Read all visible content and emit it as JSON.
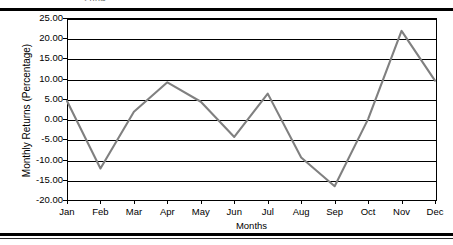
{
  "figure": {
    "top_caption_fragment": "2004",
    "background_color": "#ffffff",
    "line_color": "#808080",
    "grid_color": "#000000",
    "axis_color": "#000000"
  },
  "chart_data": {
    "type": "line",
    "title": "",
    "xlabel": "Months",
    "ylabel": "Monthly Returns (Percentage)",
    "categories": [
      "Jan",
      "Feb",
      "Mar",
      "Apr",
      "May",
      "Jun",
      "Jul",
      "Aug",
      "Sep",
      "Oct",
      "Nov",
      "Dec"
    ],
    "values": [
      4.5,
      -12.2,
      1.8,
      9.1,
      4.3,
      -4.4,
      6.3,
      -9.5,
      -16.6,
      0.0,
      21.8,
      9.5
    ],
    "ylim": [
      -20.0,
      25.0
    ],
    "ytick_values": [
      25.0,
      20.0,
      15.0,
      10.0,
      5.0,
      0.0,
      -5.0,
      -10.0,
      -15.0,
      -20.0
    ],
    "ytick_labels": [
      "25.00",
      "20.00",
      "15.00",
      "10.00",
      "5.00",
      "0.00",
      "-5.00",
      "-10.00",
      "-15.00",
      "-20.00"
    ],
    "grid": true,
    "grid_axis": "y",
    "legend": false,
    "legend_position": "none",
    "series": [
      {
        "name": "Monthly Returns",
        "values": [
          4.5,
          -12.2,
          1.8,
          9.1,
          4.3,
          -4.4,
          6.3,
          -9.5,
          -16.6,
          0.0,
          21.8,
          9.5
        ]
      }
    ]
  }
}
